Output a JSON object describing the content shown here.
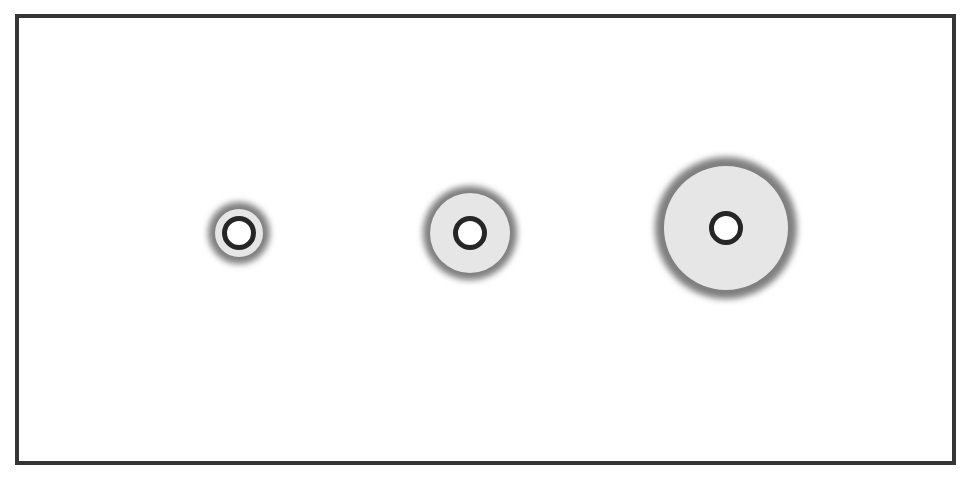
{
  "diagram": {
    "title": "Three concentric ring markers of increasing halo size",
    "frame": {
      "stroke_color": "#353535",
      "fill_color": "#ffffff"
    },
    "colors": {
      "halo": "#7f7f7f",
      "fill": "#e6e6e6",
      "ring_stroke": "#262626",
      "core": "#ffffff"
    },
    "markers": [
      {
        "label": "small",
        "cx": 239,
        "cy": 233,
        "halo_r": 34,
        "fill_r": 24,
        "ring_r": 14.5,
        "ring_stroke": 5
      },
      {
        "label": "medium",
        "cx": 470,
        "cy": 233,
        "halo_r": 50,
        "fill_r": 40,
        "ring_r": 14.5,
        "ring_stroke": 5
      },
      {
        "label": "large",
        "cx": 726,
        "cy": 228,
        "halo_r": 74,
        "fill_r": 62,
        "ring_r": 14.5,
        "ring_stroke": 5
      }
    ]
  }
}
